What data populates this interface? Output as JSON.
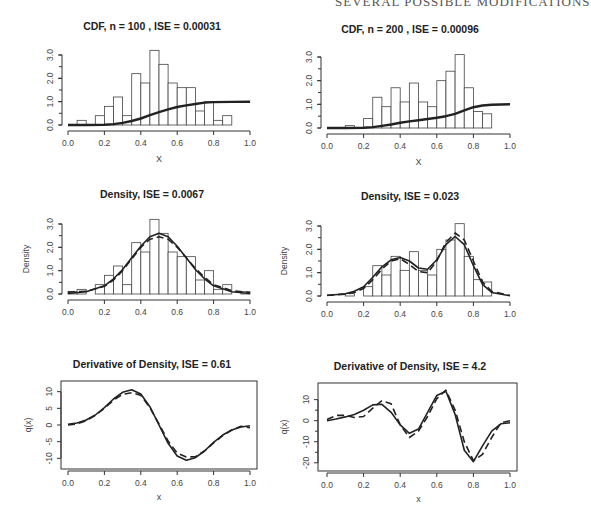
{
  "running_header": "SEVERAL POSSIBLE MODIFICATIONS",
  "chart_data": [
    {
      "id": "cdf100",
      "type": "bar",
      "title": "CDF,  n =  100 , ISE =  0.00031",
      "xlabel": "X",
      "ylabel": "",
      "xlim": [
        0,
        1
      ],
      "ylim": [
        0,
        3
      ],
      "xticks": [
        "0.0",
        "0.2",
        "0.4",
        "0.6",
        "0.8",
        "1.0"
      ],
      "yticks": [
        "0.0",
        "1.0",
        "2.0",
        "3.0"
      ],
      "bin_width": 0.05,
      "bin_starts": [
        0.0,
        0.05,
        0.1,
        0.15,
        0.2,
        0.25,
        0.3,
        0.35,
        0.4,
        0.45,
        0.5,
        0.55,
        0.6,
        0.65,
        0.7,
        0.75,
        0.8,
        0.85,
        0.9,
        0.95
      ],
      "histogram": [
        0.0,
        0.2,
        0.0,
        0.4,
        0.8,
        1.2,
        0.4,
        2.2,
        1.8,
        3.2,
        2.6,
        1.8,
        1.6,
        1.6,
        0.6,
        1.0,
        0.2,
        0.4,
        0.0,
        0.0
      ],
      "series": [
        {
          "name": "estimated CDF",
          "style": "solid-thick",
          "x": [
            0.0,
            0.1,
            0.2,
            0.25,
            0.3,
            0.35,
            0.4,
            0.45,
            0.5,
            0.55,
            0.6,
            0.65,
            0.7,
            0.75,
            0.8,
            0.9,
            1.0
          ],
          "y": [
            0.0,
            0.0,
            0.01,
            0.04,
            0.09,
            0.17,
            0.28,
            0.42,
            0.55,
            0.67,
            0.77,
            0.84,
            0.9,
            0.96,
            0.98,
            0.99,
            1.0
          ]
        }
      ]
    },
    {
      "id": "cdf200",
      "type": "bar",
      "title": "CDF,  n =  200 , ISE =  0.00096",
      "xlabel": "X",
      "ylabel": "",
      "xlim": [
        0,
        1
      ],
      "ylim": [
        0,
        3
      ],
      "xticks": [
        "0.0",
        "0.2",
        "0.4",
        "0.6",
        "0.8",
        "1.0"
      ],
      "yticks": [
        "0.0",
        "1.0",
        "2.0",
        "3.0"
      ],
      "bin_width": 0.05,
      "bin_starts": [
        0.0,
        0.05,
        0.1,
        0.15,
        0.2,
        0.25,
        0.3,
        0.35,
        0.4,
        0.45,
        0.5,
        0.55,
        0.6,
        0.65,
        0.7,
        0.75,
        0.8,
        0.85,
        0.9,
        0.95
      ],
      "histogram": [
        0.0,
        0.0,
        0.1,
        0.0,
        0.4,
        1.3,
        0.9,
        1.7,
        1.1,
        1.9,
        1.1,
        0.9,
        2.0,
        2.4,
        3.1,
        1.7,
        0.7,
        0.6,
        0.0,
        0.0
      ],
      "series": [
        {
          "name": "estimated CDF",
          "style": "solid-thick",
          "x": [
            0.0,
            0.1,
            0.2,
            0.25,
            0.3,
            0.35,
            0.4,
            0.45,
            0.5,
            0.55,
            0.6,
            0.65,
            0.7,
            0.75,
            0.8,
            0.85,
            0.9,
            1.0
          ],
          "y": [
            0.0,
            0.0,
            0.01,
            0.04,
            0.09,
            0.15,
            0.22,
            0.28,
            0.33,
            0.38,
            0.43,
            0.5,
            0.6,
            0.75,
            0.88,
            0.95,
            0.98,
            1.0
          ]
        }
      ]
    },
    {
      "id": "density100",
      "type": "bar",
      "title": "Density,  ISE =  0.0067",
      "xlabel": "",
      "ylabel": "Density",
      "xlim": [
        0,
        1
      ],
      "ylim": [
        0,
        3
      ],
      "xticks": [
        "0.0",
        "0.2",
        "0.4",
        "0.6",
        "0.8",
        "1.0"
      ],
      "yticks": [
        "0.0",
        "1.0",
        "2.0",
        "3.0"
      ],
      "bin_width": 0.05,
      "bin_starts": [
        0.0,
        0.05,
        0.1,
        0.15,
        0.2,
        0.25,
        0.3,
        0.35,
        0.4,
        0.45,
        0.5,
        0.55,
        0.6,
        0.65,
        0.7,
        0.75,
        0.8,
        0.85,
        0.9,
        0.95
      ],
      "histogram": [
        0.1,
        0.2,
        0.0,
        0.4,
        0.8,
        1.2,
        0.4,
        2.2,
        1.8,
        3.2,
        2.6,
        1.8,
        1.6,
        1.6,
        0.6,
        1.0,
        0.2,
        0.4,
        0.0,
        0.1
      ],
      "series": [
        {
          "name": "true density",
          "style": "solid",
          "x": [
            0.0,
            0.1,
            0.2,
            0.25,
            0.3,
            0.35,
            0.4,
            0.45,
            0.5,
            0.55,
            0.6,
            0.65,
            0.7,
            0.75,
            0.8,
            0.9,
            1.0
          ],
          "y": [
            0.02,
            0.1,
            0.35,
            0.65,
            1.05,
            1.55,
            2.05,
            2.45,
            2.6,
            2.45,
            2.05,
            1.55,
            1.05,
            0.65,
            0.35,
            0.1,
            0.02
          ]
        },
        {
          "name": "estimate",
          "style": "dashed",
          "x": [
            0.0,
            0.1,
            0.2,
            0.25,
            0.3,
            0.35,
            0.4,
            0.45,
            0.5,
            0.55,
            0.6,
            0.65,
            0.7,
            0.75,
            0.8,
            0.9,
            1.0
          ],
          "y": [
            0.08,
            0.12,
            0.33,
            0.6,
            1.0,
            1.5,
            2.0,
            2.35,
            2.45,
            2.35,
            2.0,
            1.55,
            1.1,
            0.72,
            0.4,
            0.14,
            0.05
          ]
        }
      ]
    },
    {
      "id": "density200",
      "type": "bar",
      "title": "Density,  ISE =  0.023",
      "xlabel": "",
      "ylabel": "Density",
      "xlim": [
        0,
        1
      ],
      "ylim": [
        0,
        3
      ],
      "xticks": [
        "0.0",
        "0.2",
        "0.4",
        "0.6",
        "0.8",
        "1.0"
      ],
      "yticks": [
        "0.0",
        "1.0",
        "2.0",
        "3.0"
      ],
      "bin_width": 0.05,
      "bin_starts": [
        0.0,
        0.05,
        0.1,
        0.15,
        0.2,
        0.25,
        0.3,
        0.35,
        0.4,
        0.45,
        0.5,
        0.55,
        0.6,
        0.65,
        0.7,
        0.75,
        0.8,
        0.85,
        0.9,
        0.95
      ],
      "histogram": [
        0.0,
        0.0,
        0.1,
        0.0,
        0.4,
        1.3,
        0.9,
        1.7,
        1.1,
        1.9,
        1.1,
        0.9,
        2.0,
        2.4,
        3.1,
        1.7,
        0.7,
        0.6,
        0.0,
        0.0
      ],
      "series": [
        {
          "name": "true density",
          "style": "solid",
          "x": [
            0.0,
            0.1,
            0.15,
            0.2,
            0.25,
            0.3,
            0.35,
            0.4,
            0.45,
            0.5,
            0.55,
            0.6,
            0.65,
            0.7,
            0.75,
            0.8,
            0.85,
            0.9,
            1.0
          ],
          "y": [
            0.02,
            0.1,
            0.2,
            0.4,
            0.8,
            1.25,
            1.55,
            1.65,
            1.5,
            1.2,
            1.15,
            1.55,
            2.2,
            2.55,
            2.2,
            1.3,
            0.5,
            0.15,
            0.01
          ]
        },
        {
          "name": "estimate",
          "style": "dashed",
          "x": [
            0.0,
            0.1,
            0.15,
            0.2,
            0.25,
            0.3,
            0.35,
            0.4,
            0.45,
            0.5,
            0.55,
            0.6,
            0.65,
            0.7,
            0.75,
            0.8,
            0.85,
            0.9,
            1.0
          ],
          "y": [
            0.03,
            0.08,
            0.15,
            0.32,
            0.7,
            1.15,
            1.5,
            1.6,
            1.35,
            1.05,
            1.0,
            1.5,
            2.3,
            2.7,
            2.4,
            1.5,
            0.6,
            0.2,
            0.02
          ]
        }
      ]
    },
    {
      "id": "deriv100",
      "type": "line",
      "title": "Derivative of Density,  ISE =  0.61",
      "xlabel": "x",
      "ylabel": "q(x)",
      "xlim": [
        0,
        1
      ],
      "ylim": [
        -12,
        12
      ],
      "xticks": [
        "0.0",
        "0.2",
        "0.4",
        "0.6",
        "0.8",
        "1.0"
      ],
      "yticks": [
        "-10",
        "-5",
        "0",
        "5",
        "10"
      ],
      "series": [
        {
          "name": "true derivative",
          "style": "solid",
          "x": [
            0.0,
            0.05,
            0.1,
            0.15,
            0.2,
            0.25,
            0.3,
            0.35,
            0.4,
            0.45,
            0.5,
            0.55,
            0.6,
            0.65,
            0.7,
            0.75,
            0.8,
            0.85,
            0.9,
            0.95,
            1.0
          ],
          "y": [
            0.2,
            0.6,
            1.5,
            3.0,
            5.2,
            7.8,
            9.8,
            10.6,
            9.3,
            5.5,
            0.0,
            -5.5,
            -9.3,
            -10.6,
            -9.8,
            -7.8,
            -5.2,
            -3.0,
            -1.5,
            -0.6,
            -0.2
          ]
        },
        {
          "name": "estimate",
          "style": "dashed",
          "x": [
            0.0,
            0.05,
            0.1,
            0.15,
            0.2,
            0.25,
            0.3,
            0.35,
            0.4,
            0.45,
            0.5,
            0.55,
            0.6,
            0.65,
            0.7,
            0.75,
            0.8,
            0.85,
            0.9,
            0.95,
            1.0
          ],
          "y": [
            0.0,
            0.3,
            1.3,
            2.9,
            5.0,
            7.4,
            9.2,
            9.7,
            8.9,
            5.2,
            0.3,
            -4.8,
            -8.4,
            -9.6,
            -9.5,
            -7.8,
            -5.4,
            -3.2,
            -1.5,
            -0.4,
            -0.8
          ]
        }
      ]
    },
    {
      "id": "deriv200",
      "type": "line",
      "title": "Derivative of Density,  ISE =  4.2",
      "xlabel": "x",
      "ylabel": "q(x)",
      "xlim": [
        0,
        1
      ],
      "ylim": [
        -22,
        16
      ],
      "xticks": [
        "0.0",
        "0.2",
        "0.4",
        "0.6",
        "0.8",
        "1.0"
      ],
      "yticks": [
        "-20",
        "-10",
        "0",
        "10"
      ],
      "series": [
        {
          "name": "true derivative",
          "style": "solid",
          "x": [
            0.0,
            0.05,
            0.1,
            0.15,
            0.2,
            0.25,
            0.3,
            0.35,
            0.4,
            0.45,
            0.5,
            0.55,
            0.6,
            0.65,
            0.7,
            0.75,
            0.8,
            0.85,
            0.9,
            0.95,
            1.0
          ],
          "y": [
            0.0,
            0.8,
            1.8,
            3.0,
            5.0,
            7.5,
            7.8,
            4.0,
            -2.0,
            -6.0,
            -4.0,
            4.0,
            12.0,
            14.0,
            3.0,
            -14.0,
            -19.5,
            -12.0,
            -5.0,
            -1.5,
            -1.0
          ]
        },
        {
          "name": "estimate",
          "style": "dashed",
          "x": [
            0.0,
            0.05,
            0.1,
            0.15,
            0.2,
            0.25,
            0.3,
            0.35,
            0.4,
            0.45,
            0.5,
            0.55,
            0.6,
            0.65,
            0.7,
            0.75,
            0.8,
            0.85,
            0.9,
            0.95,
            1.0
          ],
          "y": [
            0.5,
            2.5,
            2.5,
            1.5,
            2.0,
            6.0,
            9.5,
            8.0,
            -2.0,
            -8.0,
            -5.0,
            2.0,
            10.5,
            14.5,
            5.0,
            -10.0,
            -19.0,
            -16.0,
            -8.0,
            -1.0,
            0.0
          ]
        }
      ]
    }
  ]
}
